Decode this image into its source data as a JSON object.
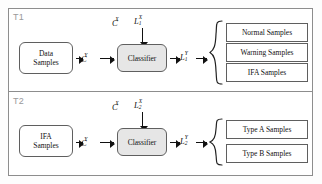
{
  "diagram": {
    "sections": [
      {
        "tag": "T1",
        "input": {
          "line1": "Data",
          "line2": "Samples"
        },
        "input_edge_label": "C",
        "input_edge_sup": "Y",
        "top_label_c": "C",
        "top_label_c_sup": "X",
        "top_label_l": "L",
        "top_label_l_sup": "X",
        "top_label_l_sub": "1",
        "process": "Classifier",
        "output_edge_label": "L",
        "output_edge_sup": "Y",
        "output_edge_sub": "1",
        "outputs": [
          "Normal  Samples",
          "Warning Samples",
          "IFA Samples"
        ]
      },
      {
        "tag": "T2",
        "input": {
          "line1": "IFA",
          "line2": "Samples"
        },
        "input_edge_label": "C",
        "input_edge_sup": "Y",
        "top_label_c": "C",
        "top_label_c_sup": "X",
        "top_label_l": "L",
        "top_label_l_sup": "X",
        "top_label_l_sub": "2",
        "process": "Classifier",
        "output_edge_label": "L",
        "output_edge_sup": "Y",
        "output_edge_sub": "2",
        "outputs": [
          "Type A Samples",
          "Type B Samples"
        ]
      }
    ],
    "colors": {
      "frame_border": "#8d8d8d",
      "box_border": "#5f5f5f",
      "process_fill": "#e6e6e6",
      "box_fill": "#ffffff",
      "tag_text": "#9a9a9a",
      "text": "#111111",
      "arrow": "#111111"
    }
  }
}
